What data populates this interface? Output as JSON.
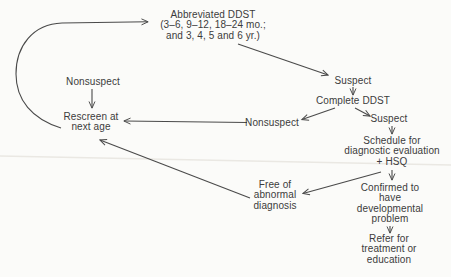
{
  "figure": {
    "type": "flowchart",
    "colors": {
      "ink": "#4a4a4a",
      "text": "#3c3c3c",
      "background": "#fbfbf9"
    }
  },
  "nodes": {
    "abbreviated_ddst": {
      "label": "Abbreviated DDST\n(3–6, 9–12, 18–24 mo.;\nand 3, 4, 5 and 6 yr.)"
    },
    "nonsuspect_left": {
      "label": "Nonsuspect"
    },
    "rescreen": {
      "label": "Rescreen at\nnext age"
    },
    "suspect_top": {
      "label": "Suspect"
    },
    "complete_ddst": {
      "label": "Complete DDST"
    },
    "nonsuspect_center": {
      "label": "Nonsuspect"
    },
    "suspect_right": {
      "label": "Suspect"
    },
    "schedule": {
      "label": "Schedule for\ndiagnostic evaluation\n+ HSQ"
    },
    "free_of_abnormal": {
      "label": "Free of\nabnormal\ndiagnosis"
    },
    "confirmed": {
      "label": "Confirmed to\nhave\ndevelopmental\nproblem"
    },
    "refer": {
      "label": "Refer for\ntreatment or\neducation"
    }
  },
  "edges": [
    {
      "from": "rescreen",
      "to": "abbreviated_ddst",
      "style": "curved"
    },
    {
      "from": "abbreviated_ddst",
      "to": "suspect_top"
    },
    {
      "from": "nonsuspect_left",
      "to": "rescreen"
    },
    {
      "from": "suspect_top",
      "to": "complete_ddst"
    },
    {
      "from": "complete_ddst",
      "to": "nonsuspect_center"
    },
    {
      "from": "complete_ddst",
      "to": "suspect_right"
    },
    {
      "from": "nonsuspect_center",
      "to": "rescreen"
    },
    {
      "from": "suspect_right",
      "to": "schedule"
    },
    {
      "from": "schedule",
      "to": "confirmed"
    },
    {
      "from": "schedule",
      "to": "free_of_abnormal"
    },
    {
      "from": "free_of_abnormal",
      "to": "rescreen"
    },
    {
      "from": "confirmed",
      "to": "refer"
    }
  ]
}
